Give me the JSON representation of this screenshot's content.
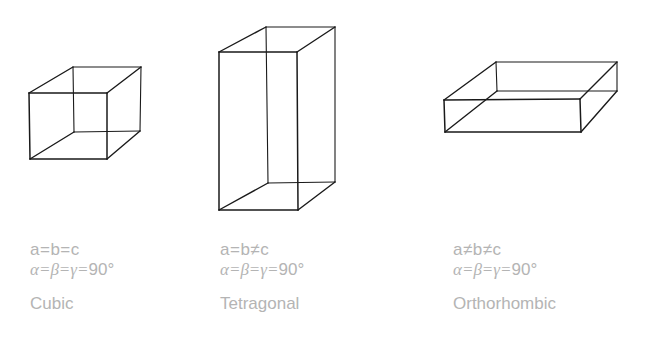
{
  "figure": {
    "background": "#ffffff",
    "line_color": "#1a1a1a",
    "text_color": "#b4b4b4"
  },
  "systems": [
    {
      "name": "Cubic",
      "relation": "a=b=c",
      "angles": "α=β=γ=",
      "angle_value": "90°",
      "box": {
        "front": [
          [
            29,
            93
          ],
          [
            107,
            93
          ],
          [
            107,
            159
          ],
          [
            30,
            159
          ]
        ],
        "back": [
          [
            73,
            67
          ],
          [
            141,
            67
          ],
          [
            140,
            131
          ],
          [
            74,
            132
          ]
        ]
      }
    },
    {
      "name": "Tetragonal",
      "relation": "a=b≠c",
      "angles": "α=β=γ=",
      "angle_value": "90°",
      "box": {
        "front": [
          [
            219,
            52
          ],
          [
            297,
            52
          ],
          [
            298,
            210
          ],
          [
            219,
            210
          ]
        ],
        "back": [
          [
            266,
            27
          ],
          [
            335,
            27
          ],
          [
            335,
            182
          ],
          [
            268,
            183
          ]
        ]
      }
    },
    {
      "name": "Orthorhombic",
      "relation": "a≠b≠c",
      "angles": "α=β=γ=",
      "angle_value": "90°",
      "box": {
        "front": [
          [
            444,
            100
          ],
          [
            580,
            99
          ],
          [
            581,
            132
          ],
          [
            445,
            132
          ]
        ],
        "back": [
          [
            496,
            62
          ],
          [
            617,
            62
          ],
          [
            617,
            91
          ],
          [
            497,
            91
          ]
        ]
      }
    }
  ]
}
